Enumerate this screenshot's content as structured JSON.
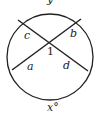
{
  "diagram": {
    "type": "circle-with-intersecting-chords",
    "labels": {
      "top_arc": "y°",
      "bottom_arc": "x°",
      "center_angle": "1",
      "segment_upper_left": "c",
      "segment_upper_right": "b",
      "segment_lower_left": "a",
      "segment_lower_right": "d"
    },
    "colors": {
      "stroke": "#222222",
      "background": "#ffffff"
    }
  }
}
